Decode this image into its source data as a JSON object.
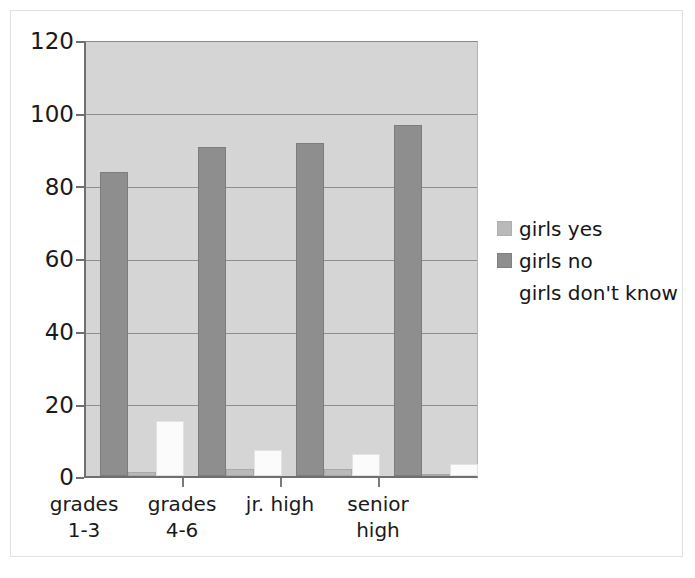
{
  "chart_data": {
    "type": "bar",
    "title": "",
    "subtitle": "",
    "xlabel": "",
    "ylabel": "",
    "categories": [
      "grades 1-3",
      "grades 4-6",
      "jr. high",
      "senior high"
    ],
    "category_lines": [
      [
        "grades",
        "1-3"
      ],
      [
        "grades",
        "4-6"
      ],
      [
        "jr. high",
        ""
      ],
      [
        "senior",
        "high"
      ]
    ],
    "series": [
      {
        "name": "girls yes",
        "color": "#b9b9b9",
        "values": [
          1,
          2,
          2,
          0
        ]
      },
      {
        "name": "girls no",
        "color": "#8e8e8e",
        "values": [
          84,
          91,
          92,
          97
        ]
      },
      {
        "name": "girls don't know",
        "color": "#ffffff",
        "values": [
          15,
          7,
          6,
          3
        ]
      }
    ],
    "ylim": [
      0,
      120
    ],
    "yticks": [
      0,
      20,
      40,
      60,
      80,
      100,
      120
    ],
    "ytick_labels": [
      "0",
      "20",
      "40",
      "60",
      "80",
      "100",
      "120"
    ],
    "grid": true,
    "grid_axis": "y",
    "legend_position": "right",
    "plot_background": "#d5d5d5"
  },
  "legend": {
    "entries": [
      {
        "label": "girls yes",
        "swatch": "legend-swatch-girls-yes"
      },
      {
        "label": "girls no",
        "swatch": "legend-swatch-girls-no"
      },
      {
        "label": "girls don't know",
        "swatch": "legend-swatch-girls-dont-know"
      }
    ]
  },
  "axes": {
    "y_labels": [
      "120",
      "100",
      "80",
      "60",
      "40",
      "20",
      "0"
    ],
    "x_labels": [
      {
        "line1": "grades",
        "line2": "1-3"
      },
      {
        "line1": "grades",
        "line2": "4-6"
      },
      {
        "line1": "jr. high",
        "line2": ""
      },
      {
        "line1": "senior",
        "line2": "high"
      }
    ]
  }
}
